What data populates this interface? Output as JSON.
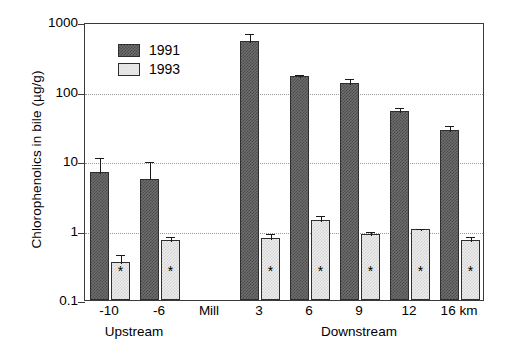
{
  "chart_data": {
    "type": "bar",
    "title": "",
    "xlabel": "",
    "ylabel": "Chlorophenolics in bile (µg/g)",
    "yscale": "log",
    "ylim": [
      0.1,
      1000
    ],
    "yticks": [
      "1000",
      "100",
      "10",
      "1",
      "0.1"
    ],
    "ytick_values": [
      1000,
      100,
      10,
      1,
      0.1
    ],
    "grid": "horizontal-dotted",
    "legend_position": "top-left",
    "categories": [
      "-10",
      "-6",
      "Mill",
      "3",
      "6",
      "9",
      "12",
      "16 km"
    ],
    "group_labels": [
      {
        "label": "Upstream",
        "categories": [
          "-10",
          "-6"
        ]
      },
      {
        "label": "Downstream",
        "categories": [
          "3",
          "6",
          "9",
          "12",
          "16 km"
        ]
      }
    ],
    "series": [
      {
        "name": "1991",
        "color": "#5a5a5a",
        "values": [
          7.0,
          5.6,
          null,
          530,
          165,
          133,
          53,
          28
        ],
        "err_low": [
          4.2,
          3.3,
          null,
          400,
          150,
          112,
          46,
          24
        ],
        "err_high": [
          11.8,
          10.2,
          null,
          720,
          185,
          160,
          62,
          34
        ]
      },
      {
        "name": "1993",
        "color": "#e9e9e9",
        "values": [
          0.35,
          0.72,
          null,
          0.78,
          1.4,
          0.9,
          1.05,
          0.72
        ],
        "err_low": [
          0.3,
          0.62,
          null,
          0.68,
          1.22,
          0.8,
          0.98,
          0.63
        ],
        "err_high": [
          0.47,
          0.86,
          null,
          0.95,
          1.7,
          1.02,
          1.12,
          0.86
        ]
      }
    ],
    "annotations": [
      {
        "symbol": "*",
        "series": "1993",
        "category": "-10"
      },
      {
        "symbol": "*",
        "series": "1993",
        "category": "-6"
      },
      {
        "symbol": "*",
        "series": "1993",
        "category": "3"
      },
      {
        "symbol": "*",
        "series": "1993",
        "category": "6"
      },
      {
        "symbol": "*",
        "series": "1993",
        "category": "9"
      },
      {
        "symbol": "*",
        "series": "1993",
        "category": "12"
      },
      {
        "symbol": "*",
        "series": "1993",
        "category": "16 km"
      }
    ]
  },
  "legend": {
    "entries": [
      {
        "label": "1991"
      },
      {
        "label": "1993"
      }
    ]
  },
  "axis": {
    "y_title": "Chlorophenolics in bile (µg/g)"
  }
}
